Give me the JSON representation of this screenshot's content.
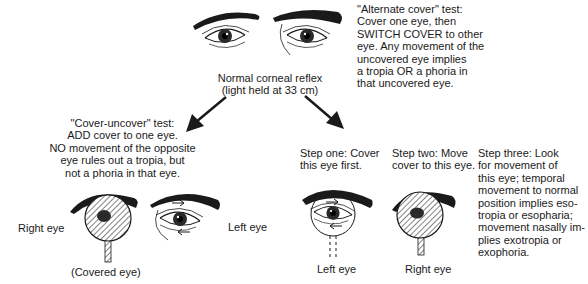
{
  "top": {
    "normal_reflex_label": "Normal corneal reflex\n(light held at 33 cm)",
    "alternate_cover_text": "\"Alternate cover\" test:\nCover one eye, then\nSWITCH COVER to other\neye.  Any movement of the\nuncovered eye implies\na tropia OR a phoria in\nthat uncovered eye."
  },
  "cover_uncover": {
    "description": "\"Cover-uncover\" test:\nADD cover to one eye.\nNO movement of the opposite\neye rules out a tropia, but\nnot a phoria in that eye.",
    "right_eye_label": "Right eye",
    "left_eye_label": "Left eye",
    "covered_eye_label": "(Covered eye)"
  },
  "alternate_steps": {
    "step_one": "Step one:  Cover\nthis eye first.",
    "step_two": "Step two:  Move\ncover to this eye.",
    "step_three": "Step three:  Look\nfor movement of\nthis eye; temporal\nmovement to normal\nposition implies eso-\ntropia or esopharia;\nmovement nasally im-\nplies exotropia or\nexophoria.",
    "left_eye_label": "Left eye",
    "right_eye_label": "Right eye"
  },
  "icons": {
    "arrows": [
      "arrow-down-left",
      "arrow-down-right"
    ],
    "occluder": "occluder-paddle",
    "eyes": "eye-illustration"
  },
  "colors": {
    "ink": "#1a1a1a",
    "background": "#ffffff"
  }
}
